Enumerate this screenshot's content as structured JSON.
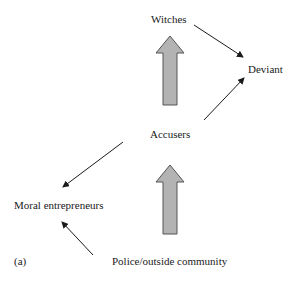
{
  "diagram": {
    "nodes": {
      "witches": "Witches",
      "deviant": "Deviant",
      "accusers": "Accusers",
      "moral_entrepreneurs": "Moral entrepreneurs",
      "police": "Police/outside community"
    },
    "panel_label": "(a)",
    "edges": [
      {
        "from": "Witches",
        "to": "Deviant",
        "type": "thin-arrow"
      },
      {
        "from": "Accusers",
        "to": "Deviant",
        "type": "thin-arrow"
      },
      {
        "from": "Accusers",
        "to": "Moral entrepreneurs",
        "type": "thin-arrow"
      },
      {
        "from": "Police/outside community",
        "to": "Moral entrepreneurs",
        "type": "thin-arrow"
      },
      {
        "from": "Accusers",
        "to": "Witches",
        "type": "block-arrow"
      },
      {
        "from": "Police/outside community",
        "to": "Accusers",
        "type": "block-arrow"
      }
    ],
    "colors": {
      "block_arrow_fill": "#b3b3b3",
      "block_arrow_stroke": "#555555",
      "line": "#1a1a1a"
    }
  }
}
